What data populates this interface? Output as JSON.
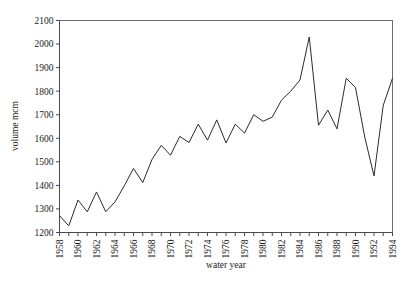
{
  "chart_data": {
    "type": "line",
    "title": "",
    "xlabel": "water year",
    "ylabel": "volume mcm",
    "xlim": [
      1958,
      1994
    ],
    "ylim": [
      1200,
      2100
    ],
    "grid": false,
    "legend": false,
    "y_ticks": [
      1200,
      1300,
      1400,
      1500,
      1600,
      1700,
      1800,
      1900,
      2000,
      2100
    ],
    "y_tick_labels": [
      "1200",
      "1300",
      "1400",
      "1500",
      "1600",
      "1700",
      "1800",
      "1900",
      "2000",
      "2100"
    ],
    "x_ticks": [
      1958,
      1959,
      1960,
      1961,
      1962,
      1963,
      1964,
      1965,
      1966,
      1967,
      1968,
      1969,
      1970,
      1971,
      1972,
      1973,
      1974,
      1975,
      1976,
      1977,
      1978,
      1979,
      1980,
      1981,
      1982,
      1983,
      1984,
      1985,
      1986,
      1987,
      1988,
      1989,
      1990,
      1991,
      1992,
      1993,
      1994
    ],
    "x_tick_labels": [
      "1958",
      "1960",
      "1962",
      "1964",
      "1966",
      "1968",
      "1970",
      "1972",
      "1974",
      "1976",
      "1978",
      "1980",
      "1982",
      "1984",
      "1986",
      "1988",
      "1990",
      "1992",
      "1994"
    ],
    "x_tick_label_years": [
      1958,
      1960,
      1962,
      1964,
      1966,
      1968,
      1970,
      1972,
      1974,
      1976,
      1978,
      1980,
      1982,
      1984,
      1986,
      1988,
      1990,
      1992,
      1994
    ],
    "x_tick_label_interval": 2,
    "x": [
      1958,
      1959,
      1960,
      1961,
      1962,
      1963,
      1964,
      1965,
      1966,
      1967,
      1968,
      1969,
      1970,
      1971,
      1972,
      1973,
      1974,
      1975,
      1976,
      1977,
      1978,
      1979,
      1980,
      1981,
      1982,
      1983,
      1984,
      1985,
      1986,
      1987,
      1988,
      1989,
      1990,
      1991,
      1992,
      1993,
      1994
    ],
    "values": [
      1272,
      1228,
      1338,
      1288,
      1372,
      1288,
      1330,
      1398,
      1472,
      1412,
      1510,
      1570,
      1528,
      1608,
      1582,
      1660,
      1592,
      1678,
      1580,
      1660,
      1622,
      1700,
      1672,
      1690,
      1762,
      1800,
      1848,
      2030,
      1655,
      1720,
      1640,
      1855,
      1815,
      1605,
      1440,
      1740,
      1855
    ],
    "series_name": "volume",
    "line_color": "#2b2b2b",
    "background_color": "#ffffff",
    "border_color": "#6e6e6e"
  }
}
